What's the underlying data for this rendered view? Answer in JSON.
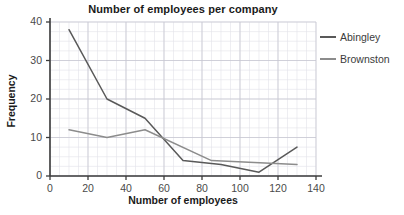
{
  "chart_data": {
    "type": "line",
    "title": "Number of employees per company",
    "xlabel": "Number of employees",
    "ylabel": "Frequency",
    "xlim": [
      0,
      140
    ],
    "ylim": [
      0,
      40
    ],
    "xticks": [
      0,
      20,
      40,
      60,
      80,
      100,
      120,
      140
    ],
    "yticks": [
      0,
      10,
      20,
      30,
      40
    ],
    "xtick_labels": [
      "0",
      "20",
      "40",
      "60",
      "80",
      "100",
      "120",
      "140"
    ],
    "ytick_labels": [
      "0",
      "10",
      "20",
      "30",
      "40"
    ],
    "grid": true,
    "grid_minor": true,
    "legend_position": "right",
    "series": [
      {
        "name": "Abingley",
        "color": "#595959",
        "x": [
          10,
          30,
          50,
          70,
          90,
          110,
          130
        ],
        "values": [
          38,
          20,
          15,
          4,
          3,
          1,
          7.5
        ]
      },
      {
        "name": "Brownston",
        "color": "#8c8c8c",
        "x": [
          10,
          30,
          50,
          85,
          130
        ],
        "values": [
          12,
          10,
          12,
          4,
          3
        ]
      }
    ]
  },
  "legend": {
    "items": [
      {
        "label": "Abingley",
        "color": "#595959"
      },
      {
        "label": "Brownston",
        "color": "#8c8c8c"
      }
    ]
  },
  "colors": {
    "axis": "#3c3c3c",
    "grid_major": "#c8c8d2",
    "grid_minor": "#e2e2ea",
    "background": "#ffffff",
    "text": "#1a1a1a",
    "tick_text": "#4a4a4a"
  }
}
